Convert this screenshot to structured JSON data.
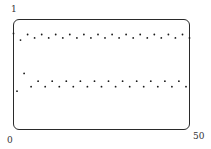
{
  "chart_data": {
    "type": "scatter",
    "title": "",
    "xlabel": "",
    "ylabel": "",
    "xlim": [
      0,
      50
    ],
    "ylim": [
      0,
      1
    ],
    "grid": false,
    "legend": null,
    "tick_labels": {
      "y_max": "1",
      "origin": "0",
      "x_max": "50"
    },
    "series": [
      {
        "name": "sequence",
        "x": [
          0,
          1,
          2,
          3,
          4,
          5,
          6,
          7,
          8,
          9,
          10,
          11,
          12,
          13,
          14,
          15,
          16,
          17,
          18,
          19,
          20,
          21,
          22,
          23,
          24,
          25,
          26,
          27,
          28,
          29,
          30,
          31,
          32,
          33,
          34,
          35,
          36,
          37,
          38,
          39,
          40,
          41,
          42,
          43,
          44,
          45,
          46,
          47,
          48,
          49,
          50
        ],
        "values": [
          0.87,
          0.35,
          0.81,
          0.51,
          0.86,
          0.39,
          0.83,
          0.44,
          0.86,
          0.39,
          0.83,
          0.44,
          0.86,
          0.39,
          0.83,
          0.44,
          0.86,
          0.39,
          0.83,
          0.44,
          0.86,
          0.39,
          0.83,
          0.44,
          0.86,
          0.39,
          0.83,
          0.44,
          0.86,
          0.39,
          0.83,
          0.44,
          0.86,
          0.39,
          0.83,
          0.44,
          0.86,
          0.39,
          0.83,
          0.44,
          0.86,
          0.39,
          0.83,
          0.44,
          0.86,
          0.39,
          0.83,
          0.44,
          0.86,
          0.39,
          0.83
        ]
      }
    ],
    "marker_color": "#1a1a1a",
    "frame_color": "#2a2a2a"
  }
}
